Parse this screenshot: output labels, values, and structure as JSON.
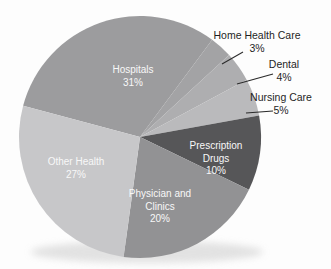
{
  "chart_data": {
    "type": "pie",
    "title": "",
    "unit": "percent",
    "legend_position": "none",
    "start_angle_deg_from_top": -75,
    "geometry": {
      "cx": 140,
      "cy": 137,
      "r": 121
    },
    "inside_label_color": "#f8f8f8",
    "outside_label_color": "#1f1f1f",
    "leader_line_color": "#2a2a2a",
    "shadow_color": "#cccccc",
    "categories": [
      "Hospitals",
      "Home Health Care",
      "Dental",
      "Nursing Care",
      "Prescription Drugs",
      "Physician and Clinics",
      "Other Health"
    ],
    "values": [
      31,
      3,
      4,
      5,
      10,
      20,
      27
    ],
    "slices": [
      {
        "label": "Hospitals",
        "pct_label": "31%",
        "value": 31,
        "color": "#9c9c9e",
        "label_placement": "inside"
      },
      {
        "label": "Home Health Care",
        "pct_label": "3%",
        "value": 3,
        "color": "#a3a3a5",
        "label_placement": "outside"
      },
      {
        "label": "Dental",
        "pct_label": "4%",
        "value": 4,
        "color": "#aeaeb0",
        "label_placement": "outside"
      },
      {
        "label": "Nursing Care",
        "pct_label": "5%",
        "value": 5,
        "color": "#bababc",
        "label_placement": "outside"
      },
      {
        "label": "Prescription Drugs",
        "pct_label": "10%",
        "value": 10,
        "color": "#565658",
        "label_placement": "inside"
      },
      {
        "label": "Physician and Clinics",
        "pct_label": "20%",
        "value": 20,
        "color": "#929294",
        "label_placement": "inside"
      },
      {
        "label": "Other Health",
        "pct_label": "27%",
        "value": 27,
        "color": "#c7c7c9",
        "label_placement": "inside"
      }
    ]
  }
}
